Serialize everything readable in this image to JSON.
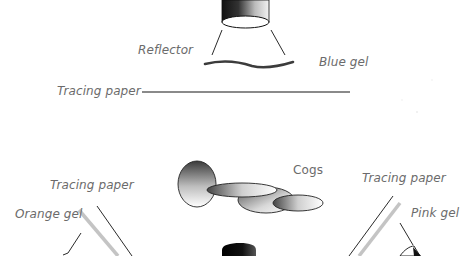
{
  "diagram": {
    "type": "lighting-setup",
    "top_light": {
      "labels": {
        "reflector": "Reflector",
        "blue_gel": "Blue gel",
        "tracing_paper": "Tracing paper"
      }
    },
    "bottom_setup": {
      "labels": {
        "cogs": "Cogs",
        "tracing_paper_left": "Tracing paper",
        "orange_gel": "Orange gel",
        "tracing_paper_right": "Tracing paper",
        "pink_gel": "Pink gel"
      }
    },
    "colors": {
      "line_dark": "#2a2a2a",
      "paper_gray": "#8a8a8a",
      "paper_light": "#c8c8c8",
      "gel_dark": "#3c3c3c",
      "label_text": "#6b6b6b",
      "background": "#ffffff"
    }
  }
}
